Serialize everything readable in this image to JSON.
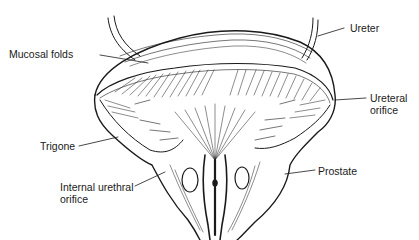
{
  "figure": {
    "style": "black-and-white anatomical line drawing",
    "colors": {
      "background": "#ffffff",
      "ink": "#1a1a1a"
    }
  },
  "labels": [
    {
      "id": "mucosal-folds",
      "text": "Mucosal folds",
      "side": "left"
    },
    {
      "id": "ureter",
      "text": "Ureter",
      "side": "right"
    },
    {
      "id": "ureteral-orifice",
      "text": "Ureteral\norifice",
      "side": "right"
    },
    {
      "id": "trigone",
      "text": "Trigone",
      "side": "left"
    },
    {
      "id": "internal-urethral-orifice",
      "text": "Internal urethral\norifice",
      "side": "left"
    },
    {
      "id": "prostate",
      "text": "Prostate",
      "side": "right"
    }
  ]
}
